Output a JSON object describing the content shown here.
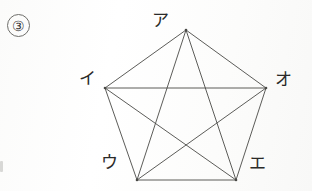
{
  "figure": {
    "item_number": "③",
    "stroke_color": "#4a4a46",
    "background_color": "#fdfdfc",
    "vertices": [
      {
        "id": "a",
        "label": "ア",
        "x": 186,
        "y": 30,
        "label_x": 152,
        "label_y": 12
      },
      {
        "id": "i",
        "label": "イ",
        "x": 105,
        "y": 88,
        "label_x": 79,
        "label_y": 70
      },
      {
        "id": "u",
        "label": "ウ",
        "x": 137,
        "y": 180,
        "label_x": 101,
        "label_y": 154
      },
      {
        "id": "e",
        "label": "エ",
        "x": 236,
        "y": 180,
        "label_x": 249,
        "label_y": 155
      },
      {
        "id": "o",
        "label": "オ",
        "x": 266,
        "y": 88,
        "label_x": 275,
        "label_y": 71
      }
    ],
    "edges": [
      {
        "from": "a",
        "to": "i",
        "kind": "side"
      },
      {
        "from": "i",
        "to": "u",
        "kind": "side"
      },
      {
        "from": "u",
        "to": "e",
        "kind": "side"
      },
      {
        "from": "e",
        "to": "o",
        "kind": "side"
      },
      {
        "from": "o",
        "to": "a",
        "kind": "side"
      },
      {
        "from": "a",
        "to": "u",
        "kind": "diagonal"
      },
      {
        "from": "a",
        "to": "e",
        "kind": "diagonal"
      },
      {
        "from": "i",
        "to": "e",
        "kind": "diagonal"
      },
      {
        "from": "i",
        "to": "o",
        "kind": "diagonal"
      },
      {
        "from": "u",
        "to": "o",
        "kind": "diagonal"
      }
    ],
    "edge_count": 10,
    "vertex_count": 5
  }
}
